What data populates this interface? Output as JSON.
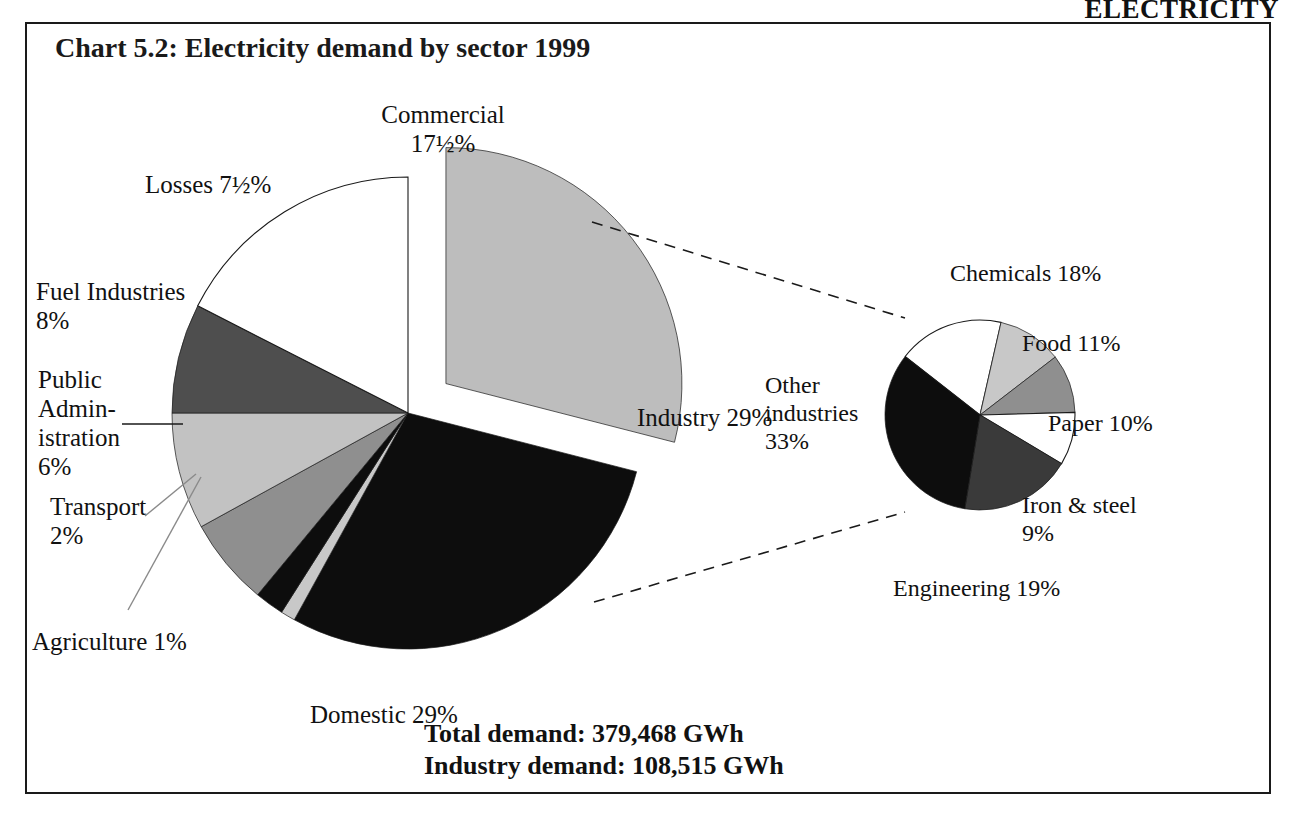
{
  "page": {
    "header": "ELECTRICITY",
    "chart_title": "Chart 5.2:  Electricity demand by sector 1999"
  },
  "footnotes": {
    "total_demand": "Total demand: 379,468 GWh",
    "industry_demand": "Industry demand: 108,515 GWh"
  },
  "labels": {
    "commercial": "Commercial\n17½%",
    "losses": "Losses 7½%",
    "fuel_industries": "Fuel Industries\n8%",
    "public_administration": "Public\nAdmin-\nistration\n6%",
    "transport": "Transport\n2%",
    "agriculture": "Agriculture 1%",
    "domestic": "Domestic 29%",
    "industry": "Industry 29%",
    "other_industries": "Other\nindustries\n33%",
    "chemicals": "Chemicals 18%",
    "food": "Food 11%",
    "paper": "Paper 10%",
    "iron_steel": "Iron & steel\n9%",
    "engineering": "Engineering 19%"
  },
  "colors": {
    "white": "#ffffff",
    "light_gray": "#c8c8c8",
    "mid_gray": "#a0a0a0",
    "dark_gray": "#585858",
    "black": "#0d0d0d",
    "outline": "#1a1a1a",
    "exploded_gray": "#bdbdbd"
  },
  "chart_data": [
    {
      "type": "pie",
      "title": "Electricity demand by sector 1999",
      "name": "main-pie",
      "unit": "%",
      "total_label": "Total demand: 379,468 GWh",
      "total_value": 379468,
      "total_unit": "GWh",
      "exploded_slice": "Industry",
      "legend": "none",
      "categories": [
        "Industry",
        "Domestic",
        "Commercial",
        "Fuel Industries",
        "Losses",
        "Public Administration",
        "Transport",
        "Agriculture"
      ],
      "values": [
        29,
        29,
        17.5,
        8,
        7.5,
        6,
        2,
        1
      ],
      "slices": [
        {
          "label": "Industry",
          "value": 29,
          "display": "Industry 29%",
          "fill": "#bdbdbd",
          "exploded": true
        },
        {
          "label": "Domestic",
          "value": 29,
          "display": "Domestic 29%",
          "fill": "#0d0d0d",
          "exploded": false
        },
        {
          "label": "Agriculture",
          "value": 1,
          "display": "Agriculture 1%",
          "fill": "#c8c8c8",
          "exploded": false
        },
        {
          "label": "Transport",
          "value": 2,
          "display": "Transport 2%",
          "fill": "#0d0d0d",
          "exploded": false
        },
        {
          "label": "Public Administration",
          "value": 6,
          "display": "Public Administration 6%",
          "fill": "#8f8f8f",
          "exploded": false
        },
        {
          "label": "Fuel Industries",
          "value": 8,
          "display": "Fuel Industries 8%",
          "fill": "#c2c2c2",
          "exploded": false
        },
        {
          "label": "Losses",
          "value": 7.5,
          "display": "Losses 7½%",
          "fill": "#4e4e4e",
          "exploded": false
        },
        {
          "label": "Commercial",
          "value": 17.5,
          "display": "Commercial 17½%",
          "fill": "#ffffff",
          "exploded": false
        }
      ]
    },
    {
      "type": "pie",
      "title": "Industry demand by sub-sector 1999",
      "name": "industry-breakdown-pie",
      "unit": "%",
      "total_label": "Industry demand: 108,515 GWh",
      "total_value": 108515,
      "total_unit": "GWh",
      "legend": "none",
      "categories": [
        "Other industries",
        "Engineering",
        "Chemicals",
        "Food",
        "Paper",
        "Iron & steel"
      ],
      "values": [
        33,
        19,
        18,
        11,
        10,
        9
      ],
      "slices": [
        {
          "label": "Chemicals",
          "value": 18,
          "display": "Chemicals 18%",
          "fill": "#ffffff"
        },
        {
          "label": "Food",
          "value": 11,
          "display": "Food 11%",
          "fill": "#c8c8c8"
        },
        {
          "label": "Paper",
          "value": 10,
          "display": "Paper 10%",
          "fill": "#8f8f8f"
        },
        {
          "label": "Iron & steel",
          "value": 9,
          "display": "Iron & steel 9%",
          "fill": "#ffffff"
        },
        {
          "label": "Engineering",
          "value": 19,
          "display": "Engineering 19%",
          "fill": "#3a3a3a"
        },
        {
          "label": "Other industries",
          "value": 33,
          "display": "Other industries 33%",
          "fill": "#0d0d0d"
        }
      ]
    }
  ]
}
